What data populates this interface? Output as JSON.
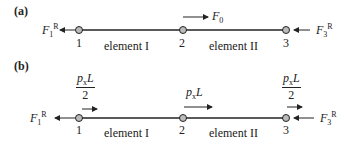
{
  "panels": [
    {
      "label": "(a)",
      "nodes": [
        "1",
        "2",
        "3"
      ],
      "elements": [
        "element I",
        "element II"
      ],
      "reaction_left": {
        "symbol": "F",
        "sub": "1",
        "sup": "R"
      },
      "reaction_right": {
        "symbol": "F",
        "sub": "3",
        "sup": "R"
      },
      "applied_force": {
        "symbol": "F",
        "sub": "0",
        "node": "2"
      }
    },
    {
      "label": "(b)",
      "nodes": [
        "1",
        "2",
        "3"
      ],
      "elements": [
        "element I",
        "element II"
      ],
      "reaction_left": {
        "symbol": "F",
        "sub": "1",
        "sup": "R"
      },
      "reaction_right": {
        "symbol": "F",
        "sub": "3",
        "sup": "R"
      },
      "loads": [
        {
          "node": "1",
          "num": "p",
          "num_sub": "x",
          "num_tail": "L",
          "den": "2"
        },
        {
          "node": "2",
          "num": "p",
          "num_sub": "x",
          "num_tail": "L"
        },
        {
          "node": "3",
          "num": "p",
          "num_sub": "x",
          "num_tail": "L",
          "den": "2"
        }
      ]
    }
  ]
}
